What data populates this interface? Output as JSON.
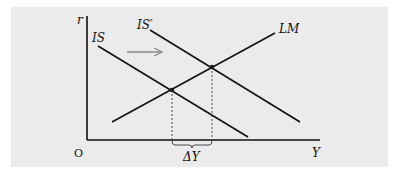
{
  "diagram": {
    "axes": {
      "y_label": "r",
      "x_label": "Y",
      "origin_label": "O"
    },
    "curves": [
      {
        "name": "IS",
        "label": "IS"
      },
      {
        "name": "IS-prime",
        "label": "IS′"
      },
      {
        "name": "LM",
        "label": "LM"
      }
    ],
    "annotations": {
      "delta_label": "ΔY",
      "shift_arrow": "rightward"
    },
    "colors": {
      "panel": "#ebebeb",
      "lines": "#111111",
      "arrow": "#8a8a8a"
    }
  }
}
